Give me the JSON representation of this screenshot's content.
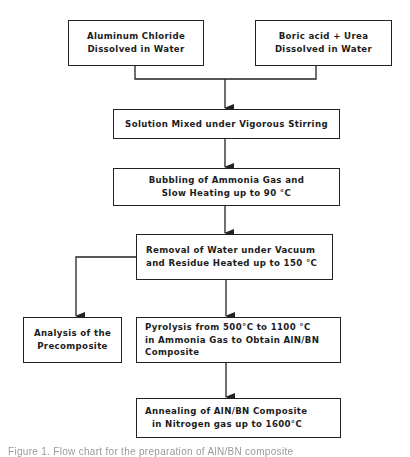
{
  "diagram": {
    "type": "flowchart",
    "nodes": {
      "aluminum_chloride": {
        "lines": [
          "Aluminum Chloride",
          "Dissolved in Water"
        ]
      },
      "boric_acid_urea": {
        "lines": [
          "Boric acid + Urea",
          "Dissolved in Water"
        ]
      },
      "solution_mixed": {
        "lines": [
          "Solution Mixed under Vigorous Stirring"
        ]
      },
      "ammonia_bubbling": {
        "lines": [
          "Bubbling of Ammonia Gas and",
          "Slow Heating up to 90 °C"
        ]
      },
      "water_removal": {
        "lines": [
          "Removal of Water under Vacuum",
          "and Residue Heated up to 150 °C"
        ]
      },
      "analysis": {
        "lines": [
          "Analysis of the",
          "Precomposite"
        ]
      },
      "pyrolysis": {
        "lines": [
          "Pyrolysis from 500°C to 1100 °C",
          "in Ammonia Gas to Obtain AlN/BN",
          "Composite"
        ]
      },
      "annealing": {
        "lines": [
          "Annealing of AlN/BN Composite",
          "in Nitrogen gas up to 1600°C"
        ]
      }
    },
    "edges": [
      {
        "from": "aluminum_chloride",
        "to": "solution_mixed"
      },
      {
        "from": "boric_acid_urea",
        "to": "solution_mixed"
      },
      {
        "from": "solution_mixed",
        "to": "ammonia_bubbling"
      },
      {
        "from": "ammonia_bubbling",
        "to": "water_removal"
      },
      {
        "from": "water_removal",
        "to": "analysis"
      },
      {
        "from": "water_removal",
        "to": "pyrolysis"
      },
      {
        "from": "pyrolysis",
        "to": "annealing"
      }
    ],
    "caption": "Figure 1. Flow chart for the preparation of AlN/BN composite"
  },
  "colors": {
    "line": "#222222",
    "text": "#1c1c1c",
    "caption": "#9a9a9a",
    "background": "#ffffff"
  }
}
